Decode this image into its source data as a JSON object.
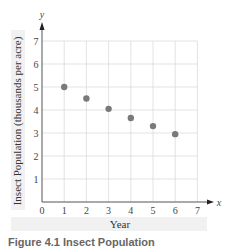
{
  "chart_data": {
    "type": "scatter",
    "title": "",
    "xlabel": "Year",
    "ylabel": "Insect Population (thousands per acre)",
    "x_axis_symbol": "x",
    "y_axis_symbol": "y",
    "xlim": [
      0,
      7
    ],
    "ylim": [
      0,
      7
    ],
    "xticks": [
      0,
      1,
      2,
      3,
      4,
      5,
      6,
      7
    ],
    "yticks": [
      1,
      2,
      3,
      4,
      5,
      6,
      7
    ],
    "grid": true,
    "legend": null,
    "series": [
      {
        "name": "Insect Population",
        "x": [
          1,
          2,
          3,
          4,
          5,
          6
        ],
        "y": [
          5.0,
          4.5,
          4.05,
          3.65,
          3.3,
          2.95
        ]
      }
    ],
    "colors": {
      "point": "#7a7a7a",
      "grid": "#dcdcdc",
      "axis": "#555555",
      "label_band": "#f1f1f1"
    }
  },
  "caption_partial": "Figure 4.1 Insect Population"
}
